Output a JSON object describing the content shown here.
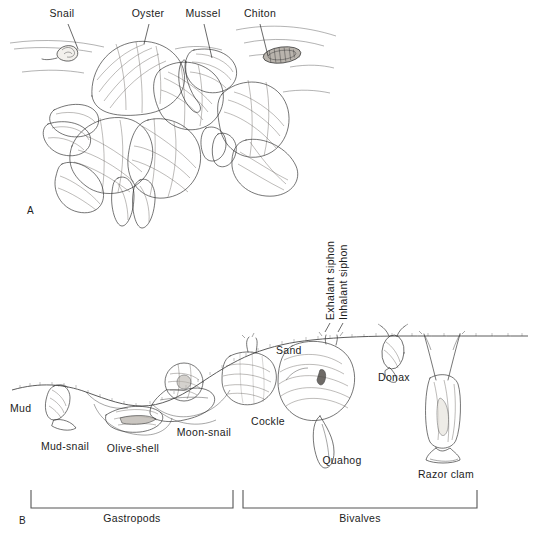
{
  "figure": {
    "title_alt": "Molluscan habitats: rocky shore assemblage (A) and soft-bottom burrowing assemblage (B)",
    "background_color": "#ffffff",
    "ink_color": "#2b2b2b",
    "text_color": "#1c1c1c"
  },
  "panel_a": {
    "panel_label": "A",
    "labels": [
      {
        "text": "Snail",
        "x": 62,
        "y": 17
      },
      {
        "text": "Oyster",
        "x": 148,
        "y": 17
      },
      {
        "text": "Mussel",
        "x": 201,
        "y": 17
      },
      {
        "text": "Chiton",
        "x": 258,
        "y": 17
      }
    ]
  },
  "panel_b": {
    "panel_label": "B",
    "substrate_labels": [
      {
        "text": "Mud",
        "x": 14,
        "y": 410
      },
      {
        "text": "Sand",
        "x": 277,
        "y": 352
      }
    ],
    "organism_labels": [
      {
        "text": "Mud-snail",
        "x": 40,
        "y": 448
      },
      {
        "text": "Olive-shell",
        "x": 105,
        "y": 450
      },
      {
        "text": "Moon-snail",
        "x": 178,
        "y": 434
      },
      {
        "text": "Cockle",
        "x": 250,
        "y": 424
      },
      {
        "text": "Quahog",
        "x": 313,
        "y": 462
      },
      {
        "text": "Donax",
        "x": 375,
        "y": 379
      },
      {
        "text": "Razor clam",
        "x": 421,
        "y": 477
      }
    ],
    "siphon_labels": [
      {
        "text": "Exhalant siphon",
        "x": 330,
        "y": 320,
        "rotation": -90
      },
      {
        "text": "Inhalant siphon",
        "x": 343,
        "y": 320,
        "rotation": -90
      }
    ],
    "brackets": [
      {
        "label": "Gastropods",
        "x_start": 31,
        "x_end": 233,
        "y": 508,
        "tick_height": 18,
        "label_x": 132,
        "label_y": 521
      },
      {
        "label": "Bivalves",
        "x_start": 243,
        "x_end": 477,
        "y": 508,
        "tick_height": 18,
        "label_x": 360,
        "label_y": 521
      }
    ]
  }
}
